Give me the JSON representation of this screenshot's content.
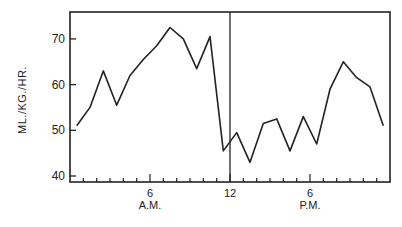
{
  "chart_data": {
    "type": "line",
    "title": "",
    "xlabel": "",
    "ylabel": "ML./KG./HR.",
    "ylim": [
      38,
      75
    ],
    "xlim": [
      0,
      24
    ],
    "grid": false,
    "legend": null,
    "y_ticks": [
      40,
      50,
      60,
      70
    ],
    "x_tick_labels": [
      {
        "hour": 6,
        "label": "6",
        "sublabel": "A.M."
      },
      {
        "hour": 12,
        "label": "12",
        "sublabel": ""
      },
      {
        "hour": 18,
        "label": "6",
        "sublabel": "P.M."
      }
    ],
    "annotations": [
      {
        "type": "vertical-line",
        "x": 12,
        "label": "noon"
      }
    ],
    "x": [
      0.5,
      1.5,
      2.5,
      3.5,
      4.5,
      5.5,
      6.5,
      7.5,
      8.5,
      9.5,
      10.5,
      11.5,
      12.5,
      13.5,
      14.5,
      15.5,
      16.5,
      17.5,
      18.5,
      19.5,
      20.5,
      21.5,
      22.5,
      23.5
    ],
    "series": [
      {
        "name": "ML./KG./HR.",
        "values": [
          51,
          55,
          63,
          55.5,
          62,
          65.5,
          68.5,
          72.5,
          70,
          63.5,
          70.5,
          45.5,
          49.5,
          43,
          51.5,
          52.5,
          45.5,
          53,
          47,
          59,
          65,
          61.5,
          59.5,
          51
        ]
      }
    ]
  }
}
